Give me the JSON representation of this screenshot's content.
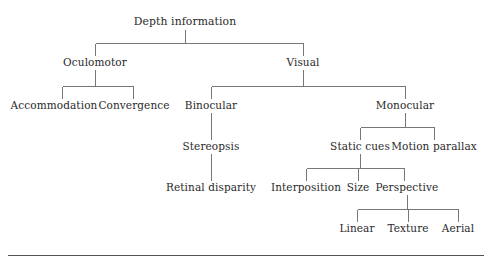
{
  "diagram": {
    "title": "Depth information",
    "type": "hierarchical-tree",
    "line_color": "#777777",
    "text_color": "#2a2a2a",
    "background_color": "#ffffff",
    "rule": {
      "present": true,
      "color": "#555555",
      "x1": 8,
      "x2": 484,
      "y": 255
    },
    "nodes": [
      {
        "id": "depth-information",
        "label": "Depth information",
        "x": 185,
        "y": 22,
        "level": 0
      },
      {
        "id": "oculomotor",
        "label": "Oculomotor",
        "x": 95,
        "y": 62,
        "level": 1
      },
      {
        "id": "visual",
        "label": "Visual",
        "x": 303,
        "y": 62,
        "level": 1
      },
      {
        "id": "accommodation",
        "label": "Accommodation",
        "x": 54,
        "y": 105,
        "level": 2
      },
      {
        "id": "convergence",
        "label": "Convergence",
        "x": 134,
        "y": 105,
        "level": 2
      },
      {
        "id": "binocular",
        "label": "Binocular",
        "x": 211,
        "y": 105,
        "level": 2
      },
      {
        "id": "monocular",
        "label": "Monocular",
        "x": 405,
        "y": 105,
        "level": 2
      },
      {
        "id": "stereopsis",
        "label": "Stereopsis",
        "x": 211,
        "y": 146,
        "level": 3
      },
      {
        "id": "static-cues",
        "label": "Static cues",
        "x": 360,
        "y": 146,
        "level": 3
      },
      {
        "id": "motion-parallax",
        "label": "Motion parallax",
        "x": 434,
        "y": 146,
        "level": 3
      },
      {
        "id": "retinal-disparity",
        "label": "Retinal disparity",
        "x": 211,
        "y": 187,
        "level": 4
      },
      {
        "id": "interposition",
        "label": "Interposition",
        "x": 306,
        "y": 187,
        "level": 4
      },
      {
        "id": "size",
        "label": "Size",
        "x": 358,
        "y": 187,
        "level": 4
      },
      {
        "id": "perspective",
        "label": "Perspective",
        "x": 407,
        "y": 187,
        "level": 4
      },
      {
        "id": "linear",
        "label": "Linear",
        "x": 357,
        "y": 228,
        "level": 5
      },
      {
        "id": "texture",
        "label": "Texture",
        "x": 408,
        "y": 228,
        "level": 5
      },
      {
        "id": "aerial",
        "label": "Aerial",
        "x": 458,
        "y": 228,
        "level": 5
      }
    ],
    "edges": [
      {
        "from": "depth-information",
        "to": "oculomotor"
      },
      {
        "from": "depth-information",
        "to": "visual"
      },
      {
        "from": "oculomotor",
        "to": "accommodation"
      },
      {
        "from": "oculomotor",
        "to": "convergence"
      },
      {
        "from": "visual",
        "to": "binocular"
      },
      {
        "from": "visual",
        "to": "monocular"
      },
      {
        "from": "binocular",
        "to": "stereopsis"
      },
      {
        "from": "stereopsis",
        "to": "retinal-disparity"
      },
      {
        "from": "monocular",
        "to": "static-cues"
      },
      {
        "from": "monocular",
        "to": "motion-parallax"
      },
      {
        "from": "static-cues",
        "to": "interposition"
      },
      {
        "from": "static-cues",
        "to": "size"
      },
      {
        "from": "static-cues",
        "to": "perspective"
      },
      {
        "from": "perspective",
        "to": "linear"
      },
      {
        "from": "perspective",
        "to": "texture"
      },
      {
        "from": "perspective",
        "to": "aerial"
      }
    ]
  }
}
